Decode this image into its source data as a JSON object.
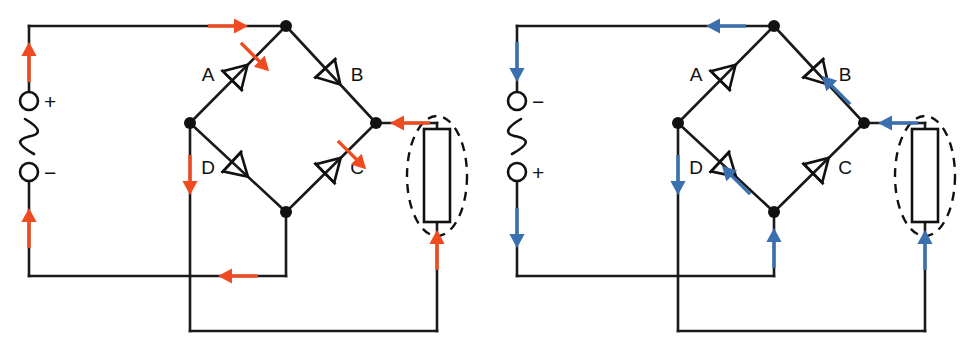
{
  "figure": {
    "width": 976,
    "height": 345,
    "background": "#ffffff",
    "wire_color": "#1a1a1a"
  },
  "colors": {
    "flow_positive_half": "#f04a20",
    "flow_negative_half": "#3a6fb0",
    "wire": "#1a1a1a",
    "node": "#111111",
    "background": "#ffffff"
  },
  "circuits": [
    {
      "id": "left-circuit",
      "name": "positive-half-cycle",
      "origin_x": 0,
      "flow_color": "#f04a20",
      "source": {
        "name": "ac-source",
        "top_terminal_label": "+",
        "bottom_terminal_label": "−",
        "symbol": "sine-wave",
        "sine_mirrored": false
      },
      "diodes": [
        {
          "id": "A",
          "label": "A",
          "label_side": "left",
          "conducting": true,
          "position": "top-left"
        },
        {
          "id": "B",
          "label": "B",
          "label_side": "right",
          "conducting": false,
          "position": "top-right"
        },
        {
          "id": "C",
          "label": "C",
          "label_side": "right",
          "conducting": true,
          "position": "bottom-right"
        },
        {
          "id": "D",
          "label": "D",
          "label_side": "left",
          "conducting": false,
          "position": "bottom-left"
        }
      ],
      "load": {
        "name": "load-resistor",
        "highlight": "dashed-ellipse",
        "current_direction": "up"
      },
      "arrows": [
        {
          "id": "src-top-up",
          "name": "arrow-source-top",
          "direction": "up"
        },
        {
          "id": "src-bottom-up",
          "name": "arrow-source-bottom",
          "direction": "up"
        },
        {
          "id": "top-wire-right",
          "name": "arrow-top-wire",
          "direction": "right"
        },
        {
          "id": "diode-a",
          "name": "arrow-through-diode-a",
          "direction": "up-right"
        },
        {
          "id": "diode-c",
          "name": "arrow-through-diode-c",
          "direction": "up-right"
        },
        {
          "id": "right-wire-left",
          "name": "arrow-right-wire",
          "direction": "left"
        },
        {
          "id": "left-node-down",
          "name": "arrow-left-node-down",
          "direction": "down"
        },
        {
          "id": "bottom-wire-left",
          "name": "arrow-bottom-wire",
          "direction": "left"
        },
        {
          "id": "load-up",
          "name": "arrow-through-load",
          "direction": "up"
        }
      ]
    },
    {
      "id": "right-circuit",
      "name": "negative-half-cycle",
      "origin_x": 488,
      "flow_color": "#3a6fb0",
      "source": {
        "name": "ac-source",
        "top_terminal_label": "−",
        "bottom_terminal_label": "+",
        "symbol": "sine-wave",
        "sine_mirrored": true
      },
      "diodes": [
        {
          "id": "A",
          "label": "A",
          "label_side": "left",
          "conducting": false,
          "position": "top-left"
        },
        {
          "id": "B",
          "label": "B",
          "label_side": "right",
          "conducting": true,
          "position": "top-right"
        },
        {
          "id": "C",
          "label": "C",
          "label_side": "right",
          "conducting": false,
          "position": "bottom-right"
        },
        {
          "id": "D",
          "label": "D",
          "label_side": "left",
          "conducting": true,
          "position": "bottom-left"
        }
      ],
      "load": {
        "name": "load-resistor",
        "highlight": "dashed-ellipse",
        "current_direction": "up"
      },
      "arrows": [
        {
          "id": "src-top-down",
          "name": "arrow-source-top",
          "direction": "down"
        },
        {
          "id": "src-bottom-down",
          "name": "arrow-source-bottom",
          "direction": "down"
        },
        {
          "id": "top-wire-left",
          "name": "arrow-top-wire",
          "direction": "left"
        },
        {
          "id": "diode-b",
          "name": "arrow-through-diode-b",
          "direction": "up-left"
        },
        {
          "id": "diode-d",
          "name": "arrow-through-diode-d",
          "direction": "up-left"
        },
        {
          "id": "right-wire-left",
          "name": "arrow-right-wire",
          "direction": "left"
        },
        {
          "id": "left-node-down",
          "name": "arrow-left-node-down",
          "direction": "down"
        },
        {
          "id": "bottom-stub-up",
          "name": "arrow-bottom-stub",
          "direction": "up"
        },
        {
          "id": "load-up",
          "name": "arrow-through-load",
          "direction": "up"
        }
      ]
    }
  ],
  "geometry": {
    "source_x": 29,
    "top_wire_y": 26,
    "bottom_wire_y": 276,
    "term_top_y": 101,
    "term_bottom_y": 172,
    "term_radius": 9,
    "node_top": {
      "x": 286,
      "y": 26
    },
    "node_left": {
      "x": 190,
      "y": 123
    },
    "node_right": {
      "x": 376,
      "y": 123
    },
    "node_bottom": {
      "x": 286,
      "y": 212
    },
    "node_radius": 6,
    "load_x": 437,
    "load_top_y": 129,
    "load_bottom_y": 222,
    "load_w": 26,
    "lower_wire_y": 331,
    "ellipse_rx": 30,
    "ellipse_ry": 60,
    "ellipse_cy": 176
  }
}
